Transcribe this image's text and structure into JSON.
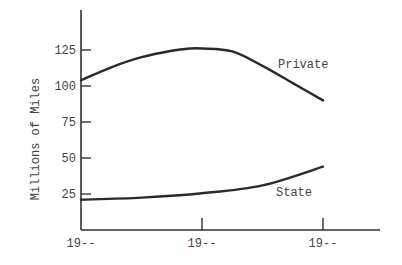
{
  "chart_data": {
    "type": "line",
    "title": "",
    "xlabel": "",
    "ylabel": "Millions of Miles",
    "categories": [
      "19--",
      "19--",
      "19--"
    ],
    "yticks": [
      25,
      50,
      75,
      100,
      125
    ],
    "ylim": [
      0,
      150
    ],
    "grid": false,
    "legend": "inline labels",
    "series": [
      {
        "name": "Private",
        "x": [
          0,
          0.25,
          0.5,
          0.75,
          0.9,
          1.0,
          1.25,
          1.5,
          1.75,
          2.0
        ],
        "values": [
          104,
          113,
          120,
          124.5,
          126,
          126,
          124,
          114,
          102,
          90
        ],
        "color": "#2a2a2a"
      },
      {
        "name": "State",
        "x": [
          0,
          0.5,
          1.0,
          1.5,
          2.0
        ],
        "values": [
          21,
          22.5,
          25.5,
          31,
          44
        ],
        "color": "#2a2a2a"
      }
    ]
  },
  "labels": {
    "y_title": "Millions of Miles",
    "private": "Private",
    "state": "State"
  },
  "colors": {
    "axis": "#333333",
    "line": "#2a2a2a",
    "text": "#444444"
  }
}
